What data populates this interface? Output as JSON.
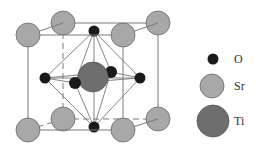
{
  "diagram": {
    "type": "crystal-structure",
    "structure": "perovskite unit cell",
    "colors": {
      "O": "#1a1a1a",
      "Sr": "#a8a8a8",
      "Ti": "#6e6e6e",
      "edge": "#7a7a7a",
      "bond": "#777777"
    }
  },
  "legend": {
    "items": [
      {
        "symbol": "O",
        "label": "O"
      },
      {
        "symbol": "Sr",
        "label": "Sr"
      },
      {
        "symbol": "Ti",
        "label": "Ti"
      }
    ]
  }
}
